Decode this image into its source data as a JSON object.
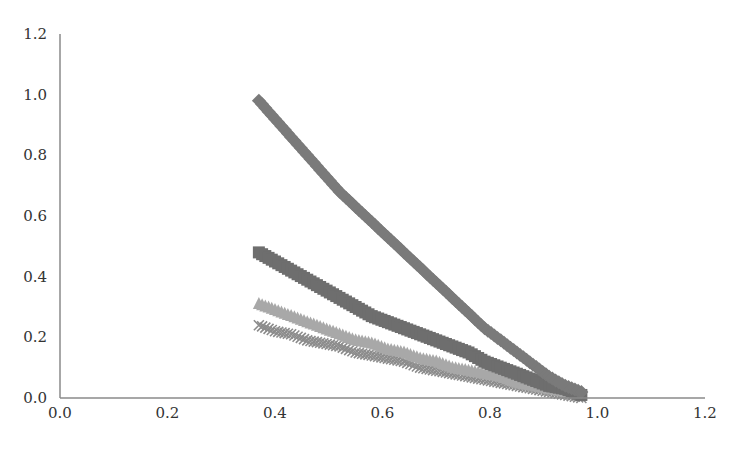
{
  "chart_data": {
    "type": "scatter",
    "title": "",
    "xlabel": "",
    "ylabel": "",
    "xlim": [
      0.0,
      1.2
    ],
    "ylim": [
      0.0,
      1.2
    ],
    "grid": false,
    "legend": null,
    "x_ticks": [
      "0.0",
      "0.2",
      "0.4",
      "0.6",
      "0.8",
      "1.0",
      "1.2"
    ],
    "y_ticks": [
      "0.0",
      "0.2",
      "0.4",
      "0.6",
      "0.8",
      "1.0",
      "1.2"
    ],
    "series": [
      {
        "name": "series-diamond",
        "marker": "diamond",
        "color": "#7a7a7a",
        "x": [
          0.37,
          0.4,
          0.43,
          0.46,
          0.49,
          0.52,
          0.55,
          0.58,
          0.61,
          0.64,
          0.67,
          0.7,
          0.73,
          0.76,
          0.79,
          0.82,
          0.85,
          0.88,
          0.91,
          0.94,
          0.97
        ],
        "y": [
          0.98,
          0.92,
          0.86,
          0.8,
          0.74,
          0.68,
          0.63,
          0.58,
          0.53,
          0.48,
          0.43,
          0.38,
          0.33,
          0.28,
          0.23,
          0.19,
          0.15,
          0.11,
          0.07,
          0.04,
          0.02
        ]
      },
      {
        "name": "series-square",
        "marker": "square",
        "color": "#6e6e6e",
        "x": [
          0.37,
          0.4,
          0.43,
          0.46,
          0.49,
          0.52,
          0.55,
          0.58,
          0.61,
          0.64,
          0.67,
          0.7,
          0.73,
          0.76,
          0.79,
          0.82,
          0.85,
          0.88,
          0.91,
          0.94,
          0.97
        ],
        "y": [
          0.48,
          0.45,
          0.42,
          0.39,
          0.36,
          0.33,
          0.3,
          0.27,
          0.25,
          0.23,
          0.21,
          0.19,
          0.17,
          0.15,
          0.12,
          0.1,
          0.08,
          0.06,
          0.04,
          0.03,
          0.01
        ]
      },
      {
        "name": "series-triangle",
        "marker": "triangle",
        "color": "#a8a8a8",
        "x": [
          0.37,
          0.4,
          0.43,
          0.46,
          0.49,
          0.52,
          0.55,
          0.58,
          0.61,
          0.64,
          0.67,
          0.7,
          0.73,
          0.76,
          0.79,
          0.82,
          0.85,
          0.88,
          0.91,
          0.94,
          0.97
        ],
        "y": [
          0.31,
          0.29,
          0.27,
          0.25,
          0.23,
          0.21,
          0.19,
          0.18,
          0.16,
          0.15,
          0.13,
          0.12,
          0.1,
          0.09,
          0.08,
          0.07,
          0.05,
          0.04,
          0.03,
          0.02,
          0.01
        ]
      },
      {
        "name": "series-x",
        "marker": "x",
        "color": "#8c8c8c",
        "x": [
          0.37,
          0.4,
          0.43,
          0.46,
          0.49,
          0.52,
          0.55,
          0.58,
          0.61,
          0.64,
          0.67,
          0.7,
          0.73,
          0.76,
          0.79,
          0.82,
          0.85,
          0.88,
          0.91,
          0.94,
          0.97
        ],
        "y": [
          0.24,
          0.22,
          0.21,
          0.19,
          0.18,
          0.17,
          0.15,
          0.14,
          0.13,
          0.12,
          0.1,
          0.09,
          0.08,
          0.07,
          0.06,
          0.05,
          0.04,
          0.03,
          0.02,
          0.01,
          0.0
        ]
      }
    ]
  },
  "colors": {
    "axis": "#8a8a8a",
    "tick_text": "#333333"
  }
}
